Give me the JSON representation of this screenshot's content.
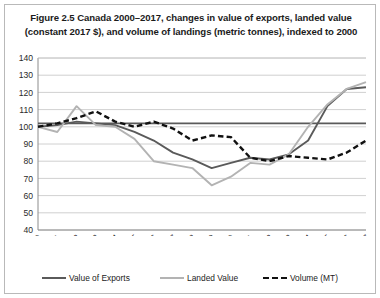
{
  "figure": {
    "title": "Figure 2.5 Canada 2000–2017, changes in value of exports, landed value (constant  2017 $), and volume of landings (metric tonnes), indexed to 2000"
  },
  "legend": {
    "items": [
      {
        "label": "Value of Exports",
        "color": "#5a5a5a",
        "style": "solid"
      },
      {
        "label": "Landed Value",
        "color": "#b3b3b3",
        "style": "solid"
      },
      {
        "label": "Volume (MT)",
        "color": "#111111",
        "style": "dashed"
      }
    ]
  },
  "axis": {
    "y_ticks": [
      "140",
      "130",
      "120",
      "110",
      "100",
      "90",
      "80",
      "70",
      "60",
      "50",
      "40"
    ],
    "x_ticks": [
      "2000",
      "2001",
      "2002",
      "2003",
      "2004",
      "2005",
      "2006",
      "2007",
      "2008",
      "2009",
      "2010",
      "2011",
      "2012",
      "2013",
      "2014",
      "2015",
      "2016",
      "2017"
    ]
  },
  "chart_data": {
    "type": "line",
    "title": "Figure 2.5 Canada 2000–2017, changes in value of exports, landed value (constant  2017 $), and volume of landings (metric tonnes), indexed to 2000",
    "xlabel": "",
    "ylabel": "",
    "categories": [
      "2000",
      "2001",
      "2002",
      "2003",
      "2004",
      "2005",
      "2006",
      "2007",
      "2008",
      "2009",
      "2010",
      "2011",
      "2012",
      "2013",
      "2014",
      "2015",
      "2016",
      "2017"
    ],
    "ylim": [
      40,
      140
    ],
    "ytick_step": 10,
    "grid": true,
    "legend_position": "bottom",
    "reference_line": {
      "value": 102,
      "color": "#5a5a5a"
    },
    "series": [
      {
        "name": "Value of Exports",
        "color": "#5a5a5a",
        "style": "solid",
        "values": [
          100,
          101,
          103,
          102,
          101,
          97,
          92,
          85,
          81,
          76,
          79,
          82,
          81,
          84,
          92,
          112,
          122,
          123
        ]
      },
      {
        "name": "Landed Value",
        "color": "#b3b3b3",
        "style": "solid",
        "values": [
          100,
          97,
          112,
          101,
          100,
          93,
          80,
          78,
          76,
          66,
          71,
          79,
          78,
          84,
          100,
          113,
          122,
          126
        ]
      },
      {
        "name": "Volume (MT)",
        "color": "#111111",
        "style": "dashed",
        "values": [
          100,
          102,
          105,
          109,
          103,
          100,
          103,
          99,
          92,
          95,
          94,
          82,
          80,
          83,
          82,
          81,
          85,
          92
        ]
      }
    ]
  }
}
